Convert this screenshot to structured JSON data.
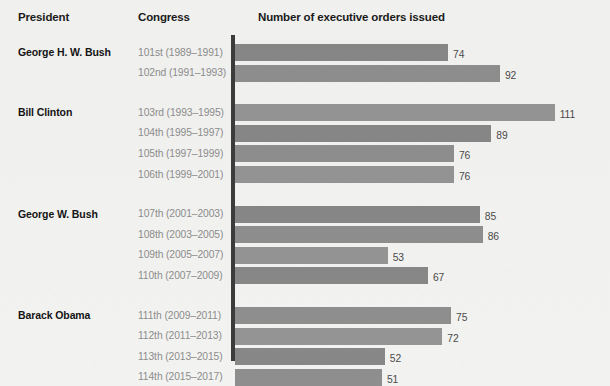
{
  "header": {
    "president": "President",
    "congress": "Congress",
    "orders": "Number of executive orders issued"
  },
  "colors": {
    "background": "#f2f2f0",
    "bar": "#8a8a8a",
    "axis": "#3c3c3c",
    "president_text": "#141414",
    "congress_text": "#8d8d8d",
    "value_text": "#4a4a4a"
  },
  "chart_data": {
    "type": "bar",
    "orientation": "horizontal",
    "title": "Number of executive orders issued",
    "xlabel": "Number of executive orders issued",
    "ylabel": "Congress",
    "xlim": [
      0,
      111
    ],
    "grid": false,
    "legend": false,
    "groups": [
      {
        "president": "George H. W. Bush",
        "rows": [
          {
            "congress": "101st (1989–1991)",
            "value": 74
          },
          {
            "congress": "102nd (1991–1993)",
            "value": 92
          }
        ]
      },
      {
        "president": "Bill Clinton",
        "rows": [
          {
            "congress": "103rd (1993–1995)",
            "value": 111
          },
          {
            "congress": "104th (1995–1997)",
            "value": 89
          },
          {
            "congress": "105th (1997–1999)",
            "value": 76
          },
          {
            "congress": "106th (1999–2001)",
            "value": 76
          }
        ]
      },
      {
        "president": "George W. Bush",
        "rows": [
          {
            "congress": "107th (2001–2003)",
            "value": 85
          },
          {
            "congress": "108th (2003–2005)",
            "value": 86
          },
          {
            "congress": "109th (2005–2007)",
            "value": 53
          },
          {
            "congress": "110th (2007–2009)",
            "value": 67
          }
        ]
      },
      {
        "president": "Barack Obama",
        "rows": [
          {
            "congress": "111th (2009–2011)",
            "value": 75
          },
          {
            "congress": "112th (2011–2013)",
            "value": 72
          },
          {
            "congress": "113th (2013–2015)",
            "value": 52
          },
          {
            "congress": "114th (2015–2017)",
            "value": 51
          }
        ]
      }
    ],
    "categories": [
      "101st (1989–1991)",
      "102nd (1991–1993)",
      "103rd (1993–1995)",
      "104th (1995–1997)",
      "105th (1997–1999)",
      "106th (1999–2001)",
      "107th (2001–2003)",
      "108th (2003–2005)",
      "109th (2005–2007)",
      "110th (2007–2009)",
      "111th (2009–2011)",
      "112th (2011–2013)",
      "113th (2013–2015)",
      "114th (2015–2017)"
    ],
    "values": [
      74,
      92,
      111,
      89,
      76,
      76,
      85,
      86,
      53,
      67,
      75,
      72,
      52,
      51
    ]
  }
}
